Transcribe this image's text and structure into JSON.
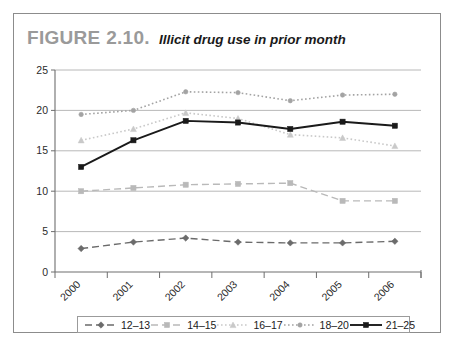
{
  "figure": {
    "label": "FIGURE 2.10.",
    "caption": "Illicit drug use in prior month"
  },
  "chart_data": {
    "type": "line",
    "title": "Illicit drug use in prior month",
    "xlabel": "",
    "ylabel": "",
    "x": [
      "2000",
      "2001",
      "2002",
      "2003",
      "2004",
      "2005",
      "2006"
    ],
    "categories": [
      "2000",
      "2001",
      "2002",
      "2003",
      "2004",
      "2005",
      "2006"
    ],
    "ylim": [
      0,
      25
    ],
    "yticks": [
      0,
      5,
      10,
      15,
      20,
      25
    ],
    "grid": true,
    "legend_position": "bottom",
    "series": [
      {
        "name": "12–13",
        "values": [
          2.9,
          3.7,
          4.2,
          3.7,
          3.6,
          3.6,
          3.8
        ],
        "color": "#6b6b6b",
        "dash": "7,4",
        "marker": "diamond",
        "width": 1.4
      },
      {
        "name": "14–15",
        "values": [
          10.0,
          10.4,
          10.8,
          10.9,
          11.0,
          8.8,
          8.8
        ],
        "color": "#b9b9b9",
        "dash": "7,4",
        "marker": "square",
        "width": 1.4
      },
      {
        "name": "16–17",
        "values": [
          16.3,
          17.7,
          19.7,
          19.0,
          17.0,
          16.6,
          15.6
        ],
        "color": "#c9c9c9",
        "dash": "1.6,2.4",
        "marker": "triangle",
        "width": 1.6
      },
      {
        "name": "18–20",
        "values": [
          19.5,
          20.0,
          22.3,
          22.2,
          21.2,
          21.9,
          22.0
        ],
        "color": "#a3a3a3",
        "dash": "1.6,2.4",
        "marker": "circle",
        "width": 1.6
      },
      {
        "name": "21–25",
        "values": [
          13.0,
          16.3,
          18.7,
          18.5,
          17.7,
          18.6,
          18.1
        ],
        "color": "#1a1a1a",
        "dash": "none",
        "marker": "square",
        "width": 1.9
      }
    ]
  },
  "legend": {
    "items": [
      {
        "label": "12–13"
      },
      {
        "label": "14–15"
      },
      {
        "label": "16–17"
      },
      {
        "label": "18–20"
      },
      {
        "label": "21–25"
      }
    ]
  }
}
